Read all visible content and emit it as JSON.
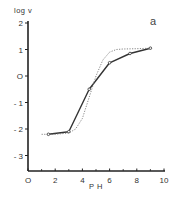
{
  "chart_data": {
    "type": "line",
    "title": "",
    "panel_label": "a",
    "xlabel": "P H",
    "ylabel": "log v",
    "xlim": [
      0,
      10
    ],
    "ylim": [
      -3.5,
      2
    ],
    "x_ticks": [
      0,
      2,
      4,
      6,
      8,
      10
    ],
    "x_tick_labels": [
      "O",
      "2",
      "4",
      "6",
      "8",
      "10"
    ],
    "x_minor_ticks": [
      1,
      3,
      5,
      7,
      9
    ],
    "y_ticks": [
      2,
      1,
      0,
      -1,
      -2,
      -3
    ],
    "y_tick_labels": [
      "2",
      "1",
      "O",
      "- 1",
      "- 2",
      "- 3"
    ],
    "grid": false,
    "legend": null,
    "series": [
      {
        "name": "observed",
        "style": "solid",
        "markers": true,
        "x": [
          1.5,
          3.0,
          4.5,
          6.0,
          7.5,
          9.0
        ],
        "y": [
          -2.2,
          -2.1,
          -0.5,
          0.5,
          0.85,
          1.05
        ]
      },
      {
        "name": "fitted",
        "style": "dotted",
        "markers": false,
        "x": [
          1.0,
          2.0,
          3.0,
          3.5,
          4.0,
          4.5,
          5.0,
          5.5,
          6.0,
          6.5,
          7.0,
          8.0,
          9.0
        ],
        "y": [
          -2.2,
          -2.2,
          -2.15,
          -2.0,
          -1.6,
          -0.8,
          0.0,
          0.6,
          0.9,
          1.0,
          1.02,
          1.03,
          1.05
        ]
      }
    ]
  }
}
